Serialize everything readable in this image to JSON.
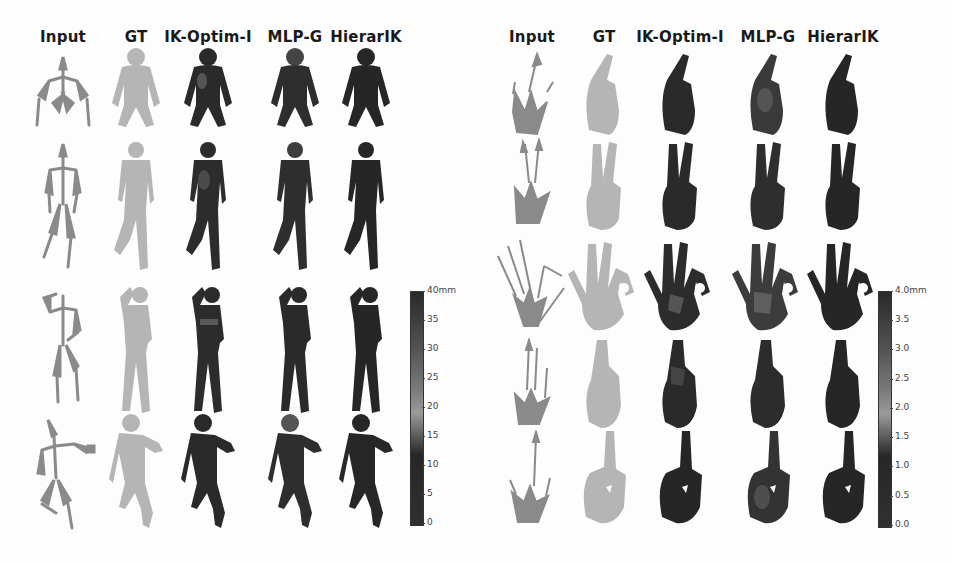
{
  "figure": {
    "panels": [
      {
        "id": "body",
        "columns": [
          "Input",
          "GT",
          "IK-Optim-I",
          "MLP-G",
          "HierarIK"
        ],
        "rows": 4,
        "row_poses": [
          "crouching",
          "standing-leg-raised",
          "hand-on-head",
          "jumping-reach"
        ],
        "colorbar": {
          "unit_label": "40mm",
          "ticks": [
            "35",
            "30",
            "25",
            "20",
            "15",
            "10",
            "5",
            "0"
          ],
          "min": 0,
          "max": 40,
          "unit": "mm"
        }
      },
      {
        "id": "hand",
        "columns": [
          "Input",
          "GT",
          "IK-Optim-I",
          "MLP-G",
          "HierarIK"
        ],
        "rows": 5,
        "row_poses": [
          "curled-pinch",
          "peace-sign",
          "ok-sign",
          "flat-pinch",
          "pointing"
        ],
        "colorbar": {
          "unit_label": "4.0mm",
          "ticks": [
            "3.5",
            "3.0",
            "2.5",
            "2.0",
            "1.5",
            "1.0",
            "0.5",
            "0.0"
          ],
          "min": 0.0,
          "max": 4.0,
          "unit": "mm"
        }
      }
    ],
    "colors": {
      "background": "#fdfdfd",
      "skeleton": "#8a8a8a",
      "gt_mesh": "#b5b5b5",
      "error_low": "#262626",
      "error_high": "#9a9a9a"
    }
  }
}
